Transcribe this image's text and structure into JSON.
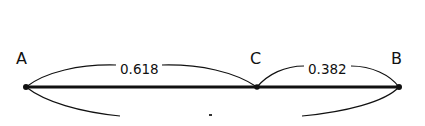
{
  "diagram": {
    "points": [
      {
        "id": "A",
        "label": "A",
        "x": 26,
        "y": 87
      },
      {
        "id": "C",
        "label": "C",
        "x": 257,
        "y": 87
      },
      {
        "id": "B",
        "label": "B",
        "x": 399,
        "y": 87
      }
    ],
    "segments": [
      {
        "from": "A",
        "to": "B",
        "style": "thick"
      }
    ],
    "arcs": [
      {
        "from": "A",
        "to": "C",
        "side": "above",
        "label": "0.618"
      },
      {
        "from": "C",
        "to": "B",
        "side": "above",
        "label": "0.382"
      },
      {
        "from": "A",
        "to": "B",
        "side": "below",
        "label": "",
        "cropped": true
      }
    ],
    "colors": {
      "stroke": "#111111",
      "background": "#ffffff"
    }
  }
}
